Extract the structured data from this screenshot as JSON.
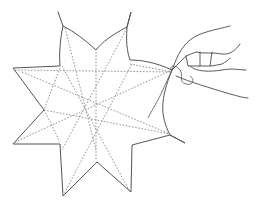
{
  "illustration": {
    "subject": "eight-pointed folded paper star with hand pulling a thread",
    "colors": {
      "background": "#ffffff",
      "outline": "#555555",
      "fold_lines": "#8a8a8a",
      "hand": "#4a4a4a"
    },
    "star_outline": "M58,12 L63,26 C60,40 59,55 60,66 L13,68 L44,110 L13,144 L60,144 L63,196 L97,162 L131,192 L132,145 L170,135 L185,143 L170,135 C160,115 160,100 172,70 C155,62 140,60 130,60 C125,45 127,35 127,27 L131,12 L127,27 C112,35 102,42 96,50 C85,40 75,32 63,26",
    "fold_lines": [
      "M65,28 L96,150",
      "M127,28 L62,150",
      "M15,70 L172,72",
      "M15,142 L172,70",
      "M22,72 L170,134",
      "M62,66 L130,192",
      "M132,64 L64,194",
      "M96,52 L96,160",
      "M60,68 L44,110 L60,142",
      "M130,64 L172,72",
      "M44,110 L170,134"
    ],
    "hand_paths": [
      "M172,70 C176,60 180,48 190,40 C200,32 215,30 230,26",
      "M172,70 C178,64 182,60 186,56 L196,52 C204,54 212,52 222,54 C230,55 236,50 240,44",
      "M186,56 L188,66 L200,66 L212,66 L222,64 C226,62 228,60 230,58",
      "M200,52 L200,66",
      "M212,52 L210,66",
      "M190,66 C196,72 210,72 222,70 C232,68 240,70 246,70",
      "M176,76 C190,82 210,88 230,94 C238,96 244,98 248,98"
    ],
    "thread_paths": [
      "M172,70 C168,66 176,64 180,70 C184,76 178,82 186,84 C192,86 196,80 190,76",
      "M172,70 L160,96 C156,104 152,110 148,118"
    ]
  }
}
